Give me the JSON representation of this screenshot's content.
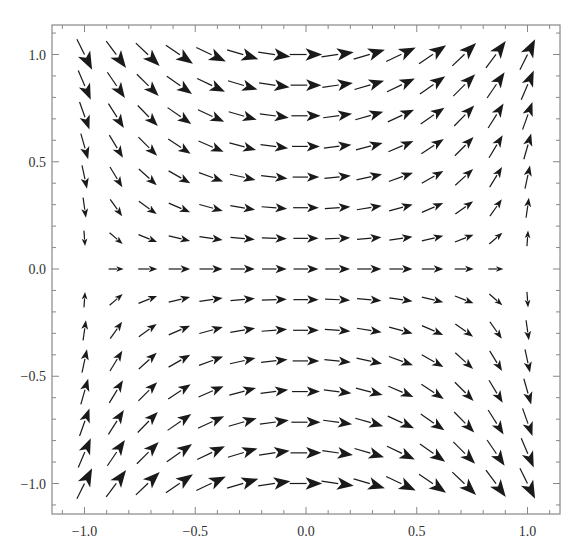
{
  "chart_data": {
    "type": "vector_field",
    "title": "",
    "xlabel": "",
    "ylabel": "",
    "field": {
      "vx": "1 - x^2 + y^2",
      "vy": "2*x*y"
    },
    "xlim": [
      -1.15,
      1.15
    ],
    "ylim": [
      -1.15,
      1.15
    ],
    "grid": false,
    "legend": null,
    "sample_grid": {
      "x_min": -1.0,
      "x_max": 1.0,
      "y_min": -1.0,
      "y_max": 1.0,
      "nx": 15,
      "ny": 15
    },
    "x_ticks": [
      -1.0,
      -0.5,
      0.0,
      0.5,
      1.0
    ],
    "y_ticks": [
      -1.0,
      -0.5,
      0.0,
      0.5,
      1.0
    ],
    "x_tick_labels": [
      "−1.0",
      "−0.5",
      "0.0",
      "0.5",
      "1.0"
    ],
    "y_tick_labels": [
      "−1.0",
      "−0.5",
      "0.0",
      "0.5",
      "1.0"
    ],
    "minor_tick_step": 0.1
  },
  "style": {
    "arrow_color": "#1a1a1a",
    "frame_color": "#888888",
    "label_color": "#333333"
  },
  "layout": {
    "frame": {
      "left": 52,
      "top": 25,
      "right": 560,
      "bottom": 514
    },
    "x0_px": 306,
    "x_scale": 221.5,
    "y0_px": 269,
    "y_scale": 214.5
  }
}
